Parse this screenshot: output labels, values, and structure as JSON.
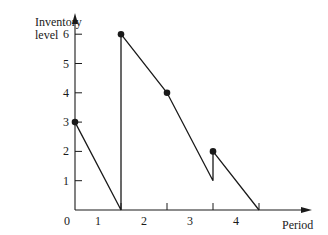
{
  "chart_data": {
    "type": "line",
    "title": "",
    "xlabel": "Period",
    "ylabel": "Inventory level",
    "ylabel_lines": [
      "Inventory",
      "level"
    ],
    "x_origin_label": "0",
    "x_tick_labels": [
      "1",
      "2",
      "3",
      "4"
    ],
    "y_tick_labels": [
      "1",
      "2",
      "3",
      "4",
      "5",
      "6"
    ],
    "xlim": [
      0,
      5.2
    ],
    "ylim": [
      0,
      6.8
    ],
    "grid": false,
    "legend": "none",
    "series": [
      {
        "name": "Inventory level",
        "points": [
          {
            "x": 0,
            "y": 3,
            "marker": true
          },
          {
            "x": 1,
            "y": 0,
            "marker": false
          },
          {
            "x": 1,
            "y": 6,
            "marker": true
          },
          {
            "x": 2,
            "y": 4,
            "marker": true
          },
          {
            "x": 3,
            "y": 1,
            "marker": false
          },
          {
            "x": 3,
            "y": 2,
            "marker": true
          },
          {
            "x": 4,
            "y": 0,
            "marker": false
          }
        ]
      }
    ],
    "color": "#1a1a1a"
  }
}
